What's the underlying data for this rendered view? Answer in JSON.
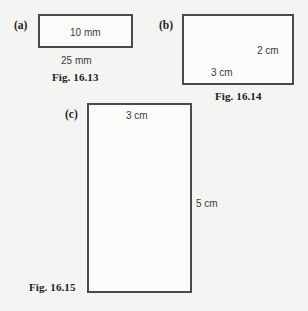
{
  "page": {
    "background_color": "#f4f4f2",
    "line_color": "#4a4a4a",
    "text_color": "#1d1d1d"
  },
  "figures": [
    {
      "part_label": "(a)",
      "caption": "Fig. 16.13",
      "shape": "rectangle",
      "width_label": "25 mm",
      "height_label": "10 mm",
      "width_value": 25,
      "height_value": 10,
      "unit": "mm"
    },
    {
      "part_label": "(b)",
      "caption": "Fig. 16.14",
      "shape": "rectangle",
      "width_label": "3 cm",
      "height_label": "2 cm",
      "width_value": 3,
      "height_value": 2,
      "unit": "cm"
    },
    {
      "part_label": "(c)",
      "caption": "Fig. 16.15",
      "shape": "rectangle",
      "width_label": "3 cm",
      "height_label": "5 cm",
      "width_value": 3,
      "height_value": 5,
      "unit": "cm"
    }
  ]
}
